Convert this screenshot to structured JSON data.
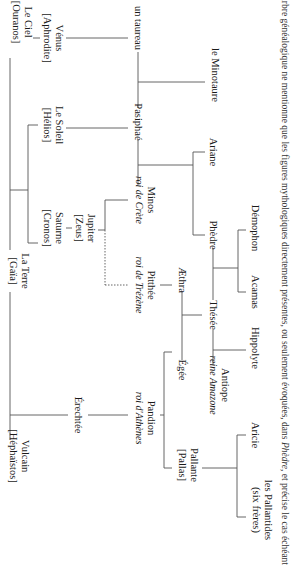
{
  "diagram": {
    "orientation": "rotated-90-clockwise",
    "nodes": {
      "ciel": {
        "name": "Le Ciel",
        "sub": "[Ouranos]"
      },
      "venus": {
        "name": "Vénus",
        "sub": "[Aphrodite]"
      },
      "taureau": {
        "name": "un taureau"
      },
      "soleil": {
        "name": "Le Soleil",
        "sub": "[Hélios]"
      },
      "pasiphae": {
        "name": "Pasiphaé"
      },
      "minotaure": {
        "name": "le Minotaure"
      },
      "terre": {
        "name": "La Terre",
        "sub": "[Gaïa]"
      },
      "saturne": {
        "name": "Saturne",
        "sub": "[Cronos]"
      },
      "jupiter": {
        "name": "Jupiter",
        "sub": "[Zeus]"
      },
      "minos": {
        "name": "Minos",
        "sub": "roi de Crète"
      },
      "ariane": {
        "name": "Ariane"
      },
      "phedre": {
        "name": "Phèdre"
      },
      "demophon": {
        "name": "Démophon"
      },
      "pitthee": {
        "name": "Pitthée",
        "sub": "roi de Trézène"
      },
      "aethra": {
        "name": "Æthra"
      },
      "thesee": {
        "name": "Thésée"
      },
      "acamas": {
        "name": "Acamas"
      },
      "hippolyte": {
        "name": "Hippolyte"
      },
      "egee": {
        "name": "Égée"
      },
      "antiope": {
        "name": "Antiope",
        "sub": "reine Amazone"
      },
      "vulcain": {
        "name": "Vulcain",
        "sub": "[Héphaïstos]"
      },
      "erechtee": {
        "name": "Érechtée"
      },
      "pandion": {
        "name": "Pandion",
        "sub": "roi d'Athènes"
      },
      "pallante": {
        "name": "Pallante",
        "sub": "[Pallas]"
      },
      "aricie": {
        "name": "Aricie"
      },
      "pallantides": {
        "name": "les Pallantides",
        "sub": "(six frères)"
      }
    },
    "caption": {
      "before": "Cet arbre généalogique ne mentionne que les figures mythologiques directement présentes, ou seulement évoquées, dans ",
      "title": "Phèdre",
      "after": ", et précise le cas échéant"
    },
    "colors": {
      "line": "#555555",
      "text": "#1a1a1a"
    }
  }
}
